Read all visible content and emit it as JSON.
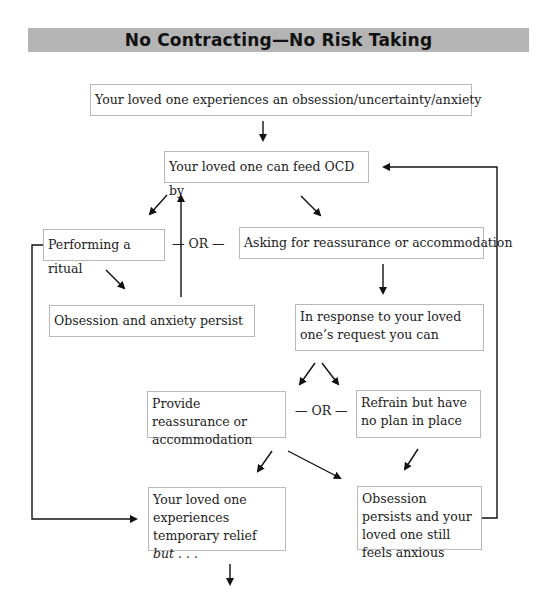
{
  "title": "No Contracting—No Risk Taking",
  "boxes": {
    "start": "Your loved one experiences an obsession/uncertainty/anxiety",
    "feed_ocd": "Your loved one can feed OCD by",
    "ritual": "Performing a ritual",
    "asking": "Asking for reassurance or accommodation",
    "obsession_persist": "Obsession and anxiety persist",
    "in_response": "In response to your loved one’s request you can",
    "provide": "Provide reassurance or accommodation",
    "refrain": "Refrain but have no plan in place",
    "relief_prefix": "Your loved one experiences temporary relief ",
    "relief_italic": "but",
    "relief_suffix": " . . .",
    "still_anxious": "Obsession persists and your loved one still feels anxious"
  },
  "connectors": {
    "or_1": "— OR —",
    "or_2": "— OR —"
  },
  "colors": {
    "title_bar": "#b4b4b4",
    "box_border": "#b8b8b8",
    "arrow": "#111111"
  }
}
